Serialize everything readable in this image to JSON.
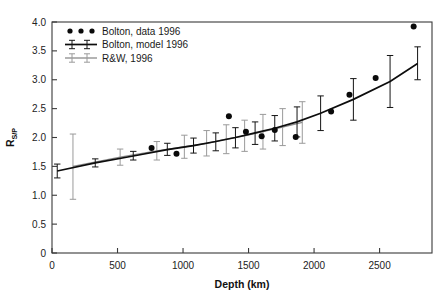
{
  "chart_data": {
    "type": "scatter",
    "title": "",
    "xlabel": "Depth (km)",
    "ylabel": "R_S/P",
    "ylabel_base": "R",
    "ylabel_sub": "S/P",
    "xlim": [
      0,
      2900
    ],
    "ylim": [
      0,
      4.0
    ],
    "xticks": [
      0,
      500,
      1000,
      1500,
      2000,
      2500
    ],
    "xticklabels": [
      "0",
      "500",
      "1000",
      "1500",
      "2000",
      "2500"
    ],
    "yticks": [
      0,
      0.5,
      1.0,
      1.5,
      2.0,
      2.5,
      3.0,
      3.5,
      4.0
    ],
    "yticklabels": [
      "0",
      "0.5",
      "1.0",
      "1.5",
      "2.0",
      "2.5",
      "3.0",
      "3.5",
      "4.0"
    ],
    "grid": false,
    "legend_position": "upper-left-inside",
    "colors": {
      "bolton_data": "#0a0a0a",
      "bolton_model": "#0d0d0d",
      "rw": "#8c8c8c",
      "axis": "#3a3a3a"
    },
    "series": [
      {
        "name": "Bolton, data 1996",
        "style": "points",
        "marker": "filled-circle",
        "color": "#0a0a0a",
        "points": [
          {
            "x": 760,
            "y": 1.82
          },
          {
            "x": 950,
            "y": 1.72
          },
          {
            "x": 1350,
            "y": 2.37
          },
          {
            "x": 1480,
            "y": 2.1
          },
          {
            "x": 1600,
            "y": 2.02
          },
          {
            "x": 1700,
            "y": 2.13
          },
          {
            "x": 1860,
            "y": 2.01
          },
          {
            "x": 2130,
            "y": 2.45
          },
          {
            "x": 2270,
            "y": 2.74
          },
          {
            "x": 2470,
            "y": 3.03
          },
          {
            "x": 2760,
            "y": 3.92
          }
        ]
      },
      {
        "name": "Bolton, model 1996",
        "style": "line-errorbar",
        "color": "#0d0d0d",
        "points": [
          {
            "x": 40,
            "y": 1.42,
            "lo": 1.3,
            "hi": 1.54
          },
          {
            "x": 330,
            "y": 1.56,
            "lo": 1.49,
            "hi": 1.63
          },
          {
            "x": 620,
            "y": 1.68,
            "lo": 1.61,
            "hi": 1.76
          },
          {
            "x": 880,
            "y": 1.79,
            "lo": 1.69,
            "hi": 1.9
          },
          {
            "x": 1080,
            "y": 1.86,
            "lo": 1.73,
            "hi": 1.99
          },
          {
            "x": 1250,
            "y": 1.93,
            "lo": 1.77,
            "hi": 2.08
          },
          {
            "x": 1400,
            "y": 2.0,
            "lo": 1.82,
            "hi": 2.17
          },
          {
            "x": 1550,
            "y": 2.08,
            "lo": 1.88,
            "hi": 2.27
          },
          {
            "x": 1700,
            "y": 2.16,
            "lo": 1.94,
            "hi": 2.38
          },
          {
            "x": 1870,
            "y": 2.27,
            "lo": 2.01,
            "hi": 2.53
          },
          {
            "x": 2050,
            "y": 2.42,
            "lo": 2.12,
            "hi": 2.72
          },
          {
            "x": 2300,
            "y": 2.66,
            "lo": 2.3,
            "hi": 3.02
          },
          {
            "x": 2580,
            "y": 2.97,
            "lo": 2.52,
            "hi": 3.42
          },
          {
            "x": 2790,
            "y": 3.28,
            "lo": 3.0,
            "hi": 3.57
          }
        ]
      },
      {
        "name": "R&W, 1996",
        "style": "line-errorbar",
        "color": "#8c8c8c",
        "points": [
          {
            "x": 160,
            "y": 1.5,
            "lo": 0.93,
            "hi": 2.06
          },
          {
            "x": 520,
            "y": 1.66,
            "lo": 1.52,
            "hi": 1.8
          },
          {
            "x": 800,
            "y": 1.77,
            "lo": 1.61,
            "hi": 1.93
          },
          {
            "x": 1010,
            "y": 1.84,
            "lo": 1.64,
            "hi": 2.04
          },
          {
            "x": 1180,
            "y": 1.9,
            "lo": 1.68,
            "hi": 2.12
          },
          {
            "x": 1330,
            "y": 1.97,
            "lo": 1.72,
            "hi": 2.22
          },
          {
            "x": 1470,
            "y": 2.03,
            "lo": 1.76,
            "hi": 2.3
          },
          {
            "x": 1610,
            "y": 2.1,
            "lo": 1.8,
            "hi": 2.4
          },
          {
            "x": 1760,
            "y": 2.18,
            "lo": 1.86,
            "hi": 2.5
          },
          {
            "x": 1910,
            "y": 2.26,
            "lo": 1.9,
            "hi": 2.62
          }
        ]
      }
    ],
    "legend": [
      {
        "label": "Bolton, data 1996",
        "marker": "three-dots",
        "color": "#0a0a0a"
      },
      {
        "label": "Bolton, model 1996",
        "marker": "line-errorbar-dark",
        "color": "#0d0d0d"
      },
      {
        "label": "R&W, 1996",
        "marker": "line-errorbar-light",
        "color": "#8c8c8c"
      }
    ]
  }
}
